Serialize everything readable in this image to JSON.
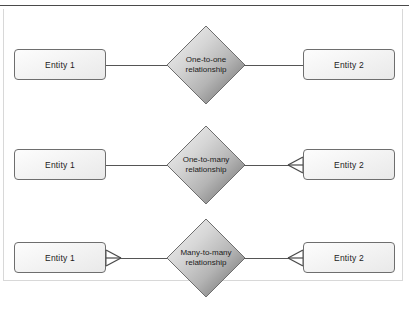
{
  "diagram": {
    "colors": {
      "line": "#555555",
      "entity_border": "#6e6e6e",
      "diamond_border": "#6e6e6e",
      "diamond_light": "#f2f2f2",
      "diamond_mid": "#c9c9c9",
      "diamond_dark": "#8f8f8f",
      "rule": "#4a4a4a",
      "text": "#1b1b1b",
      "background": "#ffffff"
    },
    "rows": [
      {
        "name": "one-to-one",
        "left_entity": "Entity 1",
        "right_entity": "Entity 2",
        "relationship_line1": "One-to-one",
        "relationship_line2": "relationship",
        "left_cardinality": "one",
        "right_cardinality": "one",
        "left_crowsfoot": false,
        "right_crowsfoot": false
      },
      {
        "name": "one-to-many",
        "left_entity": "Entity 1",
        "right_entity": "Entity 2",
        "relationship_line1": "One-to-many",
        "relationship_line2": "relationship",
        "left_cardinality": "one",
        "right_cardinality": "many",
        "left_crowsfoot": false,
        "right_crowsfoot": true
      },
      {
        "name": "many-to-many",
        "left_entity": "Entity 1",
        "right_entity": "Entity 2",
        "relationship_line1": "Many-to-many",
        "relationship_line2": "relationship",
        "left_cardinality": "many",
        "right_cardinality": "many",
        "left_crowsfoot": true,
        "right_crowsfoot": true
      }
    ]
  }
}
